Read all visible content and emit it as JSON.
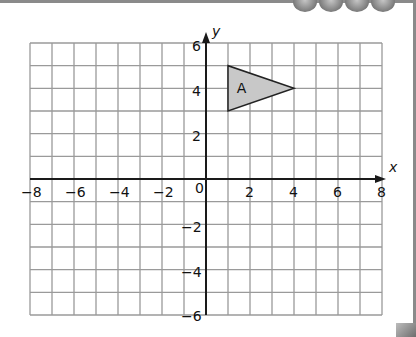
{
  "chart_data": {
    "type": "coordinate-grid",
    "title": "",
    "xlabel": "x",
    "ylabel": "y",
    "xlim": [
      -8,
      8
    ],
    "ylim": [
      -6,
      6
    ],
    "grid": true,
    "x_ticks": [
      "-8",
      "-6",
      "-4",
      "-2",
      "0",
      "2",
      "4",
      "6",
      "8"
    ],
    "y_ticks": [
      "6",
      "4",
      "2",
      "-2",
      "-4",
      "-6"
    ],
    "shapes": [
      {
        "name": "A",
        "type": "triangle",
        "vertices": [
          [
            1,
            5
          ],
          [
            1,
            3
          ],
          [
            4,
            4
          ]
        ],
        "fill": "#c8c8c8",
        "stroke": "#222222"
      }
    ]
  },
  "labels": {
    "x_axis": "x",
    "y_axis": "y",
    "origin": "0",
    "shape_a": "A",
    "xt_m8": "−8",
    "xt_m6": "−6",
    "xt_m4": "−4",
    "xt_m2": "−2",
    "xt_2": "2",
    "xt_4": "4",
    "xt_6": "6",
    "xt_8": "8",
    "yt_6": "6",
    "yt_4": "4",
    "yt_2": "2",
    "yt_m2": "−2",
    "yt_m4": "−4",
    "yt_m6": "−6"
  },
  "colors": {
    "grid": "#9a9a9a",
    "axis": "#1a1a1a",
    "shape_fill": "#c8c8c8"
  }
}
